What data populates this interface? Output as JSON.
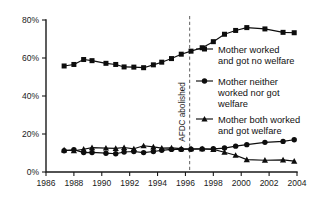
{
  "chart_data": {
    "type": "line",
    "title": "",
    "subtitle": "",
    "xlabel": "",
    "ylabel": "",
    "xlim": [
      1986,
      2004
    ],
    "ylim": [
      0,
      80
    ],
    "grid": false,
    "legend_position": "right",
    "x_ticks": [
      "1986",
      "1988",
      "1990",
      "1992",
      "1994",
      "1996",
      "1998",
      "2000",
      "2002",
      "2004"
    ],
    "x_tick_values": [
      1986,
      1988,
      1990,
      1992,
      1994,
      1996,
      1998,
      2000,
      2002,
      2004
    ],
    "y_ticks": [
      "0%",
      "20%",
      "40%",
      "60%",
      "80%"
    ],
    "y_tick_values": [
      0,
      20,
      40,
      60,
      80
    ],
    "annotations": [
      {
        "label": "AFDC abolished",
        "type": "vertical-dashed-line",
        "x": 1996.3,
        "orientation": "vertical-text"
      }
    ],
    "series": [
      {
        "name": "Mother worked and got no welfare",
        "marker": "square",
        "color": "#0d0d0d",
        "x": [
          1987.3,
          1988.0,
          1988.7,
          1989.3,
          1990.3,
          1991.0,
          1991.6,
          1992.3,
          1993.0,
          1993.7,
          1994.3,
          1995.0,
          1995.7,
          1996.4,
          1997.2,
          1998.0,
          1998.8,
          1999.6,
          2000.4,
          2001.7,
          2003.0,
          2003.8
        ],
        "values": [
          55.8,
          56.6,
          59.2,
          58.6,
          57.2,
          56.6,
          55.3,
          55.2,
          54.9,
          56.4,
          57.8,
          59.7,
          62.0,
          63.6,
          65.4,
          68.6,
          72.5,
          74.5,
          76.0,
          75.3,
          73.5,
          73.3
        ]
      },
      {
        "name": "Mother neither worked nor got welfare",
        "marker": "circle",
        "color": "#0d0d0d",
        "x": [
          1987.3,
          1988.0,
          1988.7,
          1989.3,
          1990.3,
          1991.0,
          1991.6,
          1992.3,
          1993.0,
          1993.7,
          1994.3,
          1995.0,
          1995.7,
          1996.4,
          1997.2,
          1998.0,
          1998.8,
          1999.6,
          2000.4,
          2001.7,
          2003.0,
          2003.8
        ],
        "values": [
          11.2,
          11.8,
          10.2,
          10.3,
          9.9,
          9.6,
          10.5,
          10.8,
          10.2,
          10.8,
          11.4,
          11.9,
          11.9,
          12.0,
          12.1,
          12.2,
          12.6,
          13.6,
          14.4,
          15.6,
          16.1,
          17.0
        ]
      },
      {
        "name": "Mother both worked and got welfare",
        "marker": "triangle",
        "color": "#0d0d0d",
        "x": [
          1987.3,
          1988.0,
          1988.7,
          1989.3,
          1990.3,
          1991.0,
          1991.6,
          1992.3,
          1993.0,
          1993.7,
          1994.3,
          1995.0,
          1995.7,
          1996.4,
          1997.2,
          1998.0,
          1998.8,
          1999.6,
          2000.4,
          2001.7,
          2003.0,
          2003.8
        ],
        "values": [
          11.6,
          11.2,
          12.0,
          12.8,
          12.6,
          12.4,
          12.9,
          12.2,
          13.8,
          13.2,
          12.6,
          12.7,
          12.3,
          12.2,
          12.2,
          11.9,
          10.4,
          8.8,
          6.5,
          6.2,
          6.4,
          5.7
        ]
      }
    ]
  },
  "legend": {
    "entries": [
      {
        "marker": "square",
        "lines": [
          "Mother worked",
          "and got no welfare"
        ]
      },
      {
        "marker": "circle",
        "lines": [
          "Mother neither",
          "worked nor got",
          "welfare"
        ]
      },
      {
        "marker": "triangle",
        "lines": [
          "Mother both worked",
          "and got welfare"
        ]
      }
    ]
  },
  "colors": {
    "ink": "#0d0d0d",
    "axis": "#1a1a1a",
    "annotation_line": "#6e6e6e",
    "background": "#ffffff"
  }
}
